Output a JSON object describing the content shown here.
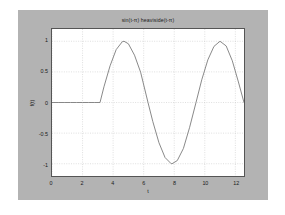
{
  "figure": {
    "panel_color": "#b3b3b3",
    "axes_background": "#ffffff",
    "axes_border_color": "#555555",
    "grid_color": "#bdbdbd",
    "line_color": "#7a7a7a"
  },
  "chart_data": {
    "type": "line",
    "title": "sin(t-π) heaviside(t-π)",
    "xlabel": "t",
    "ylabel": "f(t)",
    "grid": true,
    "legend": null,
    "xlim": [
      0,
      12.566
    ],
    "ylim": [
      -1.2,
      1.2
    ],
    "xticks": [
      0,
      2,
      4,
      6,
      8,
      10,
      12
    ],
    "xticklabels": [
      "0",
      "2",
      "4",
      "6",
      "8",
      "10",
      "12"
    ],
    "yticks": [
      1,
      0.5,
      0,
      -0.5,
      -1
    ],
    "yticklabels": [
      "1",
      "0.5",
      "0",
      "-0.5",
      "-1"
    ],
    "series": [
      {
        "name": "sin(t-π) heaviside(t-π)",
        "x": [
          0,
          0.4,
          0.8,
          1.2,
          1.6,
          2,
          2.4,
          2.8,
          3.14159,
          3.4,
          3.8,
          4.2,
          4.6,
          4.71239,
          5,
          5.4,
          5.8,
          6.28319,
          6.6,
          7,
          7.4,
          7.8,
          7.85398,
          8.2,
          8.6,
          9,
          9.42478,
          9.8,
          10.2,
          10.6,
          10.9956,
          11.4,
          11.8,
          12.2,
          12.566
        ],
        "y": [
          0,
          0,
          0,
          0,
          0,
          0,
          0,
          0,
          0,
          0.2555,
          0.5985,
          0.8632,
          0.9927,
          1,
          0.9589,
          0.7727,
          0.4941,
          0,
          -0.3123,
          -0.657,
          -0.8987,
          -0.9992,
          -1,
          -0.9477,
          -0.751,
          -0.4121,
          0,
          0.3702,
          0.6967,
          0.9162,
          1,
          0.9231,
          0.6816,
          0.335,
          0.0
        ]
      }
    ]
  }
}
